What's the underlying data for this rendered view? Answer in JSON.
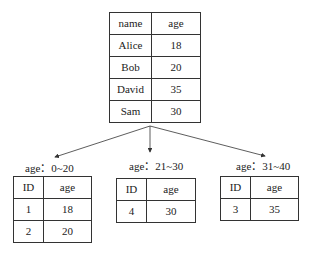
{
  "source_table": {
    "headers": [
      "name",
      "age"
    ],
    "rows": [
      [
        "Alice",
        "18"
      ],
      [
        "Bob",
        "20"
      ],
      [
        "David",
        "35"
      ],
      [
        "Sam",
        "30"
      ]
    ]
  },
  "partitions": [
    {
      "label": "age：0~20",
      "headers": [
        "ID",
        "age"
      ],
      "rows": [
        [
          "1",
          "18"
        ],
        [
          "2",
          "20"
        ]
      ]
    },
    {
      "label": "age：21~30",
      "headers": [
        "ID",
        "age"
      ],
      "rows": [
        [
          "4",
          "30"
        ]
      ]
    },
    {
      "label": "age：31~40",
      "headers": [
        "ID",
        "age"
      ],
      "rows": [
        [
          "3",
          "35"
        ]
      ]
    }
  ]
}
